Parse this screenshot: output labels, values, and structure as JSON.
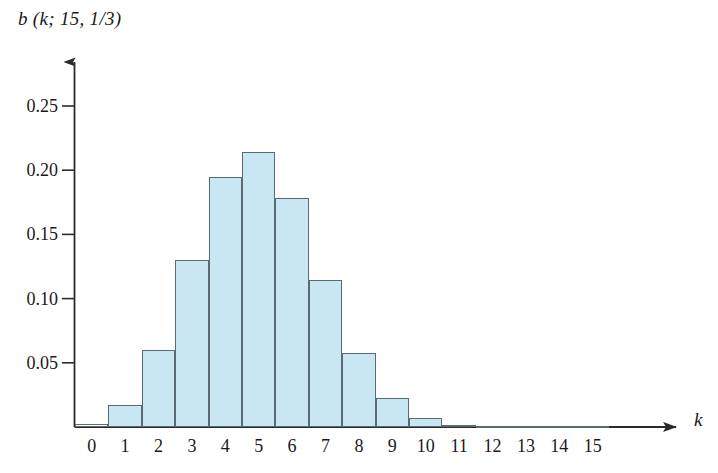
{
  "chart_data": {
    "type": "bar",
    "title": "",
    "subtitle": "",
    "ylabel": "b (k; 15, 1/3)",
    "xlabel": "k",
    "categories": [
      "0",
      "1",
      "2",
      "3",
      "4",
      "5",
      "6",
      "7",
      "8",
      "9",
      "10",
      "11",
      "12",
      "13",
      "14",
      "15"
    ],
    "values": [
      0.0023,
      0.0171,
      0.0599,
      0.1299,
      0.1948,
      0.2143,
      0.1786,
      0.1148,
      0.0574,
      0.0223,
      0.0067,
      0.0015,
      0.0003,
      4e-05,
      4e-06,
      2e-07
    ],
    "xtick_labels": [
      "0",
      "1",
      "2",
      "3",
      "4",
      "5",
      "6",
      "7",
      "8",
      "9",
      "10",
      "11",
      "12",
      "13",
      "14",
      "15"
    ],
    "ytick_labels": [
      "0.05",
      "0.10",
      "0.15",
      "0.20",
      "0.25"
    ],
    "ytick_values": [
      0.05,
      0.1,
      0.15,
      0.2,
      0.25
    ],
    "ylim": [
      0,
      0.2617
    ],
    "xlim": [
      -0.5,
      15.5
    ],
    "grid": false,
    "legend": null,
    "bar_fill_color": "#c9e6f3",
    "bar_edge_color": "#5a6a72",
    "axis_color": "#2b2b2b",
    "text_color": "#1a1a1a",
    "axis_style": "arrowed-left-and-bottom",
    "annotations": []
  }
}
